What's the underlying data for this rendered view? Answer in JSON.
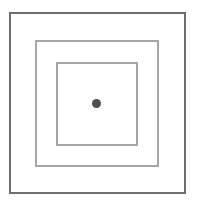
{
  "diagram": {
    "squares": [
      {
        "name": "outer",
        "stroke": "#6e6e6e"
      },
      {
        "name": "middle",
        "stroke": "#a6a6a6"
      },
      {
        "name": "inner",
        "stroke": "#a6a6a6"
      }
    ],
    "center_dot": {
      "fill": "#505050"
    }
  }
}
